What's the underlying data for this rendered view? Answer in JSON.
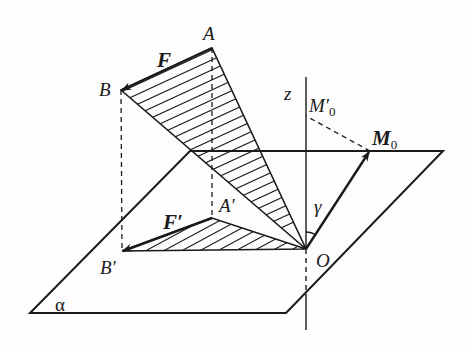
{
  "diagram": {
    "type": "geometry-figure",
    "labels": {
      "A": "A",
      "B": "B",
      "F": "F",
      "z": "z",
      "M0_prime": "M′",
      "M0_prime_sub": "0",
      "M0": "M",
      "M0_sub": "0",
      "A_prime": "A′",
      "F_prime": "F′",
      "gamma": "γ",
      "B_prime": "B′",
      "O": "O",
      "alpha": "α"
    },
    "points": {
      "A": [
        212,
        48
      ],
      "B": [
        121,
        90
      ],
      "A_prime": [
        212,
        218
      ],
      "B_prime": [
        122,
        251
      ],
      "O": [
        306,
        249
      ],
      "M0": [
        370,
        151
      ],
      "M0_prime": [
        306,
        116
      ]
    },
    "plane_alpha": [
      [
        190,
        151
      ],
      [
        443,
        151
      ],
      [
        286,
        313
      ],
      [
        30,
        313
      ]
    ],
    "colors": {
      "line": "#1a1a1a",
      "background": "#fdfdfd"
    }
  }
}
